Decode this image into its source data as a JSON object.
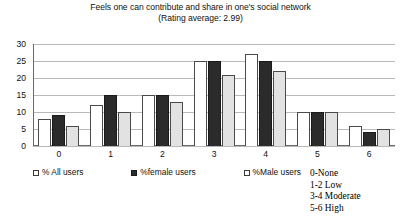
{
  "chart_data": {
    "type": "bar",
    "title": "Feels one can contribute and share in one's social network",
    "subtitle": "(Rating average: 2.99)",
    "xlabel": "",
    "ylabel": "",
    "ylim": [
      0,
      30
    ],
    "ytick_step": 5,
    "yticks": [
      30,
      25,
      20,
      15,
      10,
      5,
      0
    ],
    "categories": [
      "0",
      "1",
      "2",
      "3",
      "4",
      "5",
      "6"
    ],
    "grid": true,
    "legend_position": "bottom",
    "series": [
      {
        "name": "% All users",
        "color": "#ffffff",
        "values": [
          8,
          12,
          15,
          25,
          27,
          10,
          6
        ]
      },
      {
        "name": "%female users",
        "color": "#2b2b2b",
        "values": [
          9,
          15,
          15,
          25,
          25,
          10,
          4
        ]
      },
      {
        "name": "%Male users",
        "color": "#e2e2e2",
        "values": [
          6,
          10,
          13,
          21,
          22,
          10,
          5
        ]
      }
    ],
    "annotations": [
      "0-None",
      "1-2 Low",
      "3-4 Moderate",
      "5-6 High"
    ]
  }
}
